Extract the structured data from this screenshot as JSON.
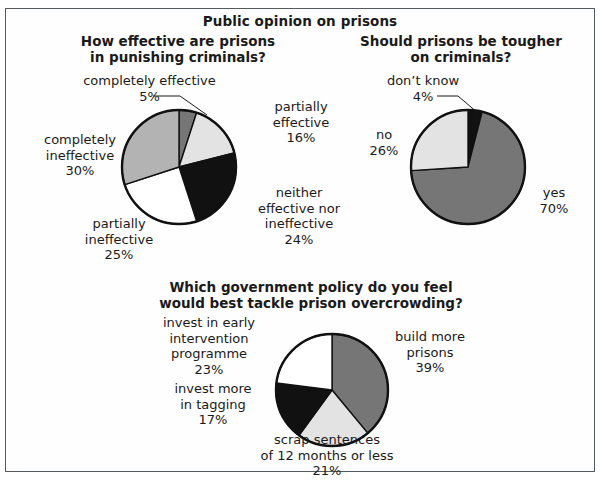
{
  "figure": {
    "main_title": "Public opinion on prisons",
    "border_color": "#555a5e",
    "background": "#ffffff"
  },
  "palette": {
    "white": "#ffffff",
    "light_gray": "#e3e3e3",
    "mid_gray": "#b3b3b3",
    "dark_gray": "#767676",
    "black": "#111111",
    "outline": "#111111"
  },
  "chart_data": [
    {
      "id": "q1",
      "type": "pie",
      "title": "How effective are prisons\nin punishing criminals?",
      "title_line1": "How effective are prisons",
      "title_line2": "in punishing criminals?",
      "legend": "labels-outside",
      "grid": false,
      "total": 100,
      "unit": "%",
      "categories": [
        "completely effective",
        "partially effective",
        "neither effective nor ineffective",
        "partially ineffective",
        "completely ineffective"
      ],
      "values": [
        5,
        16,
        24,
        25,
        30
      ],
      "colors": [
        "#767676",
        "#e3e3e3",
        "#111111",
        "#ffffff",
        "#b3b3b3"
      ],
      "labels": [
        {
          "name": "completely effective",
          "value": "5%",
          "text": "completely effective\n5%",
          "leader": true
        },
        {
          "name": "partially effective",
          "value": "16%",
          "text": "partially\neffective\n16%",
          "leader": false
        },
        {
          "name": "neither effective nor ineffective",
          "value": "24%",
          "text": "neither\neffective nor\nineffective\n24%",
          "leader": false
        },
        {
          "name": "partially ineffective",
          "value": "25%",
          "text": "partially\nineffective\n25%",
          "leader": false
        },
        {
          "name": "completely ineffective",
          "value": "30%",
          "text": "completely\nineffective\n30%",
          "leader": false
        }
      ]
    },
    {
      "id": "q2",
      "type": "pie",
      "title": "Should prisons be tougher\non criminals?",
      "title_line1": "Should prisons be tougher",
      "title_line2": "on criminals?",
      "legend": "labels-outside",
      "grid": false,
      "total": 100,
      "unit": "%",
      "categories": [
        "don't know",
        "yes",
        "no"
      ],
      "values": [
        4,
        70,
        26
      ],
      "colors": [
        "#111111",
        "#767676",
        "#e3e3e3"
      ],
      "labels": [
        {
          "name": "don't know",
          "value": "4%",
          "text": "don’t know\n4%",
          "leader": true
        },
        {
          "name": "no",
          "value": "26%",
          "text": "no\n26%",
          "leader": false
        },
        {
          "name": "yes",
          "value": "70%",
          "text": "yes\n70%",
          "leader": false
        }
      ]
    },
    {
      "id": "q3",
      "type": "pie",
      "title": "Which government policy do you feel\nwould best tackle prison overcrowding?",
      "title_line1": "Which government policy do you feel",
      "title_line2": "would best tackle prison overcrowding?",
      "legend": "labels-outside",
      "grid": false,
      "total": 100,
      "unit": "%",
      "categories": [
        "build more prisons",
        "scrap sentences of 12 months or less",
        "invest more in tagging",
        "invest in early intervention programme"
      ],
      "values": [
        39,
        21,
        17,
        23
      ],
      "colors": [
        "#767676",
        "#e3e3e3",
        "#111111",
        "#ffffff"
      ],
      "labels": [
        {
          "name": "build more prisons",
          "value": "39%",
          "text": "build more\nprisons\n39%",
          "leader": false
        },
        {
          "name": "scrap sentences of 12 months or less",
          "value": "21%",
          "text": "scrap sentences\nof 12 months or less\n21%",
          "leader": false
        },
        {
          "name": "invest more in tagging",
          "value": "17%",
          "text": "invest more\nin tagging\n17%",
          "leader": false
        },
        {
          "name": "invest in early intervention programme",
          "value": "23%",
          "text": "invest in early intervention\nprogramme\n23%",
          "leader": false
        }
      ]
    }
  ]
}
